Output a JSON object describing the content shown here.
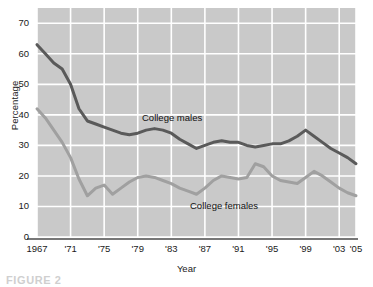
{
  "figure": {
    "caption": "FIGURE 2",
    "background_color": "#ffffff",
    "plot_background_color": "#c9c9c9",
    "grid_color": "#ffffff",
    "axis_color": "#4a4a4a"
  },
  "chart_data": {
    "type": "line",
    "title": "",
    "xlabel": "Year",
    "ylabel": "Percentage",
    "xlim": [
      1967,
      2005
    ],
    "ylim": [
      0,
      75
    ],
    "grid": true,
    "legend_position": "inline-annotation",
    "y_ticks": [
      0,
      10,
      20,
      30,
      40,
      50,
      60,
      70
    ],
    "y_tick_labels": [
      "0",
      "10",
      "20",
      "30",
      "40",
      "50",
      "60",
      "70"
    ],
    "x_ticks": [
      1967,
      1971,
      1975,
      1979,
      1983,
      1987,
      1991,
      1995,
      1999,
      2003,
      2005
    ],
    "x_tick_labels": [
      "1967",
      "'71",
      "'75",
      "'79",
      "'83",
      "'87",
      "'91",
      "'95",
      "'99",
      "'03",
      "'05"
    ],
    "x": [
      1967,
      1968,
      1969,
      1970,
      1971,
      1972,
      1973,
      1974,
      1975,
      1976,
      1977,
      1978,
      1979,
      1980,
      1981,
      1982,
      1983,
      1984,
      1985,
      1986,
      1987,
      1988,
      1989,
      1990,
      1991,
      1992,
      1993,
      1994,
      1995,
      1996,
      1997,
      1998,
      1999,
      2000,
      2001,
      2002,
      2003,
      2004,
      2005
    ],
    "series": [
      {
        "name": "College males",
        "color": "#5a5a5a",
        "label_text": "College males",
        "values": [
          63,
          60,
          57,
          55,
          50,
          42,
          38,
          37,
          36,
          35,
          34,
          33.5,
          34,
          35,
          35.5,
          35,
          34,
          32,
          30.5,
          29,
          30,
          31,
          31.5,
          31,
          31,
          30,
          29.5,
          30,
          30.5,
          30.5,
          31.5,
          33,
          35,
          33,
          31,
          29,
          27.5,
          26,
          24
        ]
      },
      {
        "name": "College females",
        "color": "#a0a0a0",
        "label_text": "College females",
        "values": [
          42,
          39,
          35,
          31,
          26,
          19,
          13.5,
          16,
          17,
          14,
          16,
          18,
          19.5,
          20,
          19.5,
          18.5,
          17.5,
          16,
          15,
          14,
          16,
          18.5,
          20,
          19.5,
          19,
          19.5,
          24,
          23,
          20,
          18.5,
          18,
          17.5,
          19.5,
          21.5,
          20,
          18,
          16,
          14.5,
          13.5
        ]
      }
    ]
  }
}
